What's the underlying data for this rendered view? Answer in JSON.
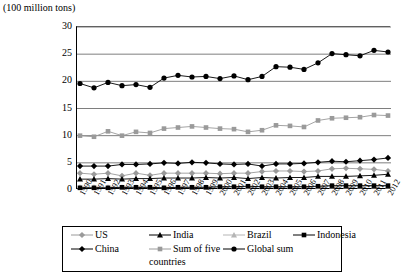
{
  "chart_data": {
    "type": "line",
    "title": "",
    "ylabel": "(100 million tons)",
    "xlabel": "",
    "ylim": [
      0,
      30
    ],
    "yticks": [
      0,
      5,
      10,
      15,
      20,
      25,
      30
    ],
    "grid": true,
    "legend_position": "bottom",
    "categories": [
      "1990",
      "1991",
      "1992",
      "1993",
      "1994",
      "1995",
      "1996",
      "1997",
      "1998",
      "1999",
      "2000",
      "2001",
      "2002",
      "2003",
      "2004",
      "2005",
      "2006",
      "2007",
      "2008",
      "2009",
      "2010",
      "2011",
      "2012"
    ],
    "series": [
      {
        "name": "Global sum",
        "marker": "circle",
        "color": "#000000",
        "values": [
          19.6,
          18.8,
          19.8,
          19.2,
          19.4,
          18.9,
          20.6,
          21.1,
          20.8,
          20.9,
          20.5,
          21.0,
          20.3,
          20.9,
          22.7,
          22.6,
          22.2,
          23.4,
          25.1,
          24.9,
          24.7,
          25.7,
          25.4
        ]
      },
      {
        "name": "Sum of five countries",
        "marker": "square",
        "color": "#9a9a9a",
        "values": [
          10.0,
          9.8,
          10.8,
          10.0,
          10.7,
          10.5,
          11.3,
          11.5,
          11.7,
          11.5,
          11.3,
          11.2,
          10.7,
          11.0,
          11.9,
          11.8,
          11.6,
          12.8,
          13.2,
          13.3,
          13.4,
          13.8,
          13.7
        ]
      },
      {
        "name": "China",
        "marker": "diamond",
        "color": "#000000",
        "values": [
          4.4,
          4.4,
          4.4,
          4.7,
          4.7,
          4.8,
          5.0,
          4.9,
          5.1,
          5.0,
          4.8,
          4.7,
          4.8,
          4.4,
          4.8,
          4.8,
          4.9,
          5.1,
          5.3,
          5.2,
          5.4,
          5.6,
          5.9
        ]
      },
      {
        "name": "US",
        "marker": "diamond",
        "color": "#9a9a9a",
        "values": [
          3.1,
          2.9,
          3.1,
          2.6,
          3.1,
          2.7,
          3.1,
          3.1,
          3.1,
          3.1,
          3.0,
          3.1,
          3.1,
          3.4,
          3.5,
          3.5,
          3.4,
          3.5,
          3.9,
          4.0,
          3.9,
          3.8,
          3.5
        ]
      },
      {
        "name": "India",
        "marker": "triangle",
        "color": "#000000",
        "values": [
          2.0,
          2.0,
          2.1,
          2.0,
          2.1,
          2.1,
          2.2,
          2.2,
          2.2,
          2.3,
          2.2,
          2.3,
          2.1,
          2.3,
          2.2,
          2.3,
          2.3,
          2.5,
          2.5,
          2.5,
          2.6,
          2.7,
          2.9
        ]
      },
      {
        "name": "Brazil",
        "marker": "triangle",
        "color": "#b5b5b5",
        "values": [
          0.5,
          0.5,
          0.5,
          0.5,
          0.5,
          0.5,
          0.4,
          0.5,
          0.5,
          0.5,
          0.6,
          0.6,
          0.6,
          0.6,
          0.6,
          0.6,
          0.6,
          0.6,
          0.7,
          0.7,
          0.7,
          0.7,
          0.7
        ]
      },
      {
        "name": "Indonesia",
        "marker": "square",
        "color": "#000000",
        "values": [
          0.4,
          0.4,
          0.4,
          0.5,
          0.5,
          0.5,
          0.4,
          0.5,
          0.5,
          0.5,
          0.6,
          0.6,
          0.7,
          0.6,
          0.6,
          0.6,
          0.6,
          0.7,
          0.8,
          0.8,
          0.8,
          0.8,
          0.8
        ]
      }
    ]
  },
  "legend": {
    "row1": [
      "US",
      "India",
      "Brazil",
      "Indonesia"
    ],
    "row2": [
      "China",
      "Sum of five",
      "Global sum"
    ],
    "continuation": "countries"
  }
}
